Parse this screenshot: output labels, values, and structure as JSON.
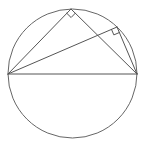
{
  "canvas": {
    "width": 144,
    "height": 147,
    "background": "#ffffff"
  },
  "colors": {
    "line": "#555555",
    "circle": "#666666"
  },
  "circle": {
    "cx": 72.5,
    "cy": 73.5,
    "r": 64.5
  },
  "points": {
    "A": {
      "x": 8,
      "y": 74
    },
    "B": {
      "x": 137,
      "y": 74
    },
    "C": {
      "x": 71,
      "y": 9
    },
    "D": {
      "x": 117,
      "y": 27
    }
  },
  "segments": [
    {
      "name": "diameter-AB",
      "from": "A",
      "to": "B"
    },
    {
      "name": "chord-AC",
      "from": "A",
      "to": "C"
    },
    {
      "name": "chord-CB",
      "from": "C",
      "to": "B"
    },
    {
      "name": "chord-AD",
      "from": "A",
      "to": "D"
    },
    {
      "name": "chord-DB",
      "from": "D",
      "to": "B"
    }
  ],
  "right_angle_markers": [
    {
      "name": "right-angle-at-C",
      "vertex": "C",
      "a": "A",
      "b": "B",
      "size": 6
    },
    {
      "name": "right-angle-at-D",
      "vertex": "D",
      "a": "A",
      "b": "B",
      "size": 6
    }
  ]
}
